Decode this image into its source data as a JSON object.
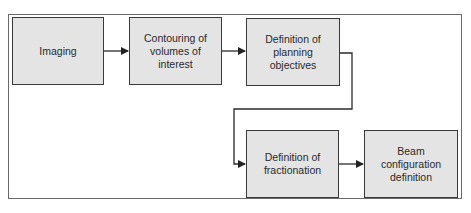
{
  "diagram": {
    "type": "flowchart",
    "nodes": [
      {
        "id": "imaging",
        "label": "Imaging"
      },
      {
        "id": "contouring",
        "label": "Contouring of volumes of interest"
      },
      {
        "id": "planning",
        "label": "Definition of planning objectives"
      },
      {
        "id": "fractionation",
        "label": "Definition of fractionation"
      },
      {
        "id": "beam",
        "label": "Beam configuration definition"
      }
    ],
    "edges": [
      {
        "from": "imaging",
        "to": "contouring"
      },
      {
        "from": "contouring",
        "to": "planning"
      },
      {
        "from": "planning",
        "to": "fractionation"
      },
      {
        "from": "fractionation",
        "to": "beam"
      }
    ],
    "colors": {
      "box_fill": "#e4e4e4",
      "box_border": "#3a3a3a",
      "line": "#2a2a2a",
      "frame": "#6a6a6a"
    }
  }
}
